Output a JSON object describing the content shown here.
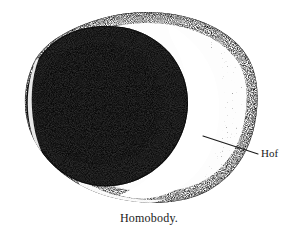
{
  "figure": {
    "caption": "Homobody.",
    "background_color": "#ffffff",
    "ink_color": "#1a1a1a"
  },
  "annotations": [
    {
      "id": "hof",
      "label": "Hof",
      "leader_line": {
        "from_x": 258,
        "from_y": 154,
        "to_x": 203,
        "to_y": 136
      }
    }
  ],
  "structures": {
    "cell_outline": {
      "name": "cell-body-outline",
      "center_x": 142,
      "center_y": 106,
      "radius_x": 116,
      "radius_y": 94
    },
    "nucleus": {
      "name": "dark-nucleus",
      "center_x": 104,
      "center_y": 104,
      "radius_x": 82,
      "radius_y": 80
    },
    "hof_region": {
      "name": "bright-hof-crescent",
      "description": "pale perinuclear clear zone on right side"
    },
    "rim": {
      "name": "dark-outer-rim",
      "description": "stippled dark cytoplasmic border"
    }
  }
}
